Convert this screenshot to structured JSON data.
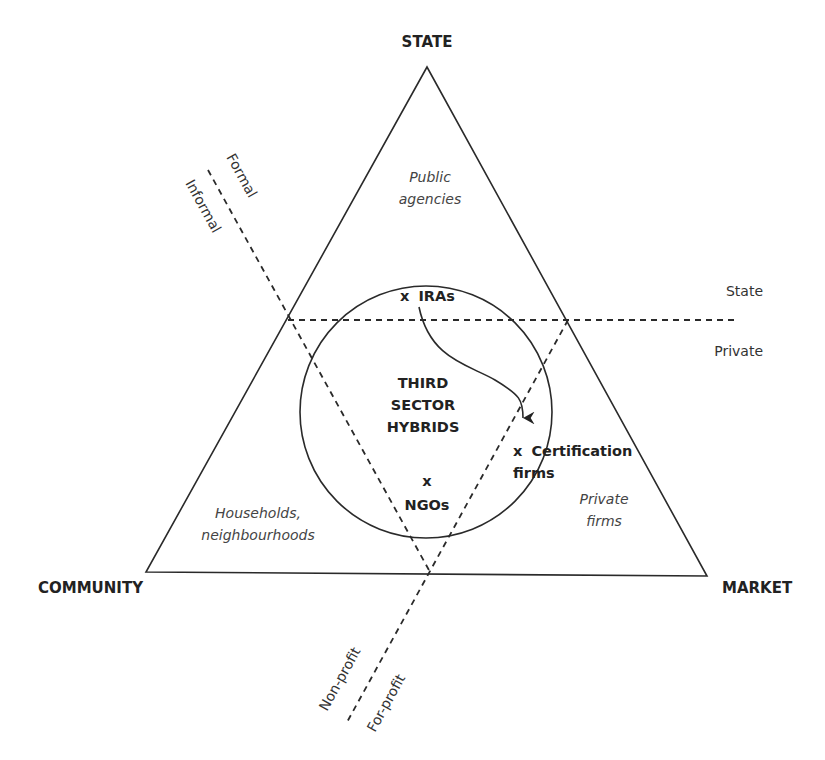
{
  "vertices": {
    "top": "STATE",
    "bottom_left": "COMMUNITY",
    "bottom_right": "MARKET"
  },
  "sectors": {
    "state": [
      "Public",
      "agencies"
    ],
    "community": [
      "Households,",
      "neighbourhoods"
    ],
    "market": [
      "Private",
      "firms"
    ]
  },
  "dividers": {
    "horizontal": {
      "upper": "State",
      "lower": "Private"
    },
    "formal_informal": {
      "upper": "Formal",
      "lower": "Informal"
    },
    "profit": {
      "left": "Non-profit",
      "right": "For-profit"
    }
  },
  "hybrid_zone": {
    "title": [
      "THIRD",
      "SECTOR",
      "HYBRIDS"
    ],
    "items": [
      {
        "marker": "x",
        "label": "IRAs"
      },
      {
        "marker": "x",
        "label": "Certification",
        "label2": "firms"
      },
      {
        "marker": "x",
        "label": "NGOs"
      }
    ],
    "arrow": {
      "from": "IRAs",
      "to": "Certification firms"
    }
  },
  "colors": {
    "line": "#2a2a2a",
    "text": "#222222",
    "italic_text": "#444444"
  }
}
